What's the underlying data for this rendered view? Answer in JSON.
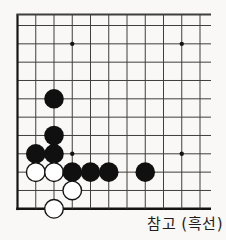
{
  "caption": "참고 (흑선)",
  "board": {
    "cols": 11,
    "rows": 11,
    "edges": {
      "left": true,
      "bottom": true,
      "top": false,
      "right": false
    },
    "star_points": [
      {
        "col": 4,
        "row": 2
      },
      {
        "col": 10,
        "row": 2
      },
      {
        "col": 4,
        "row": 8
      },
      {
        "col": 10,
        "row": 8
      }
    ],
    "stones": [
      {
        "col": 3,
        "row": 5,
        "color": "black"
      },
      {
        "col": 3,
        "row": 7,
        "color": "black"
      },
      {
        "col": 2,
        "row": 8,
        "color": "black"
      },
      {
        "col": 3,
        "row": 8,
        "color": "black"
      },
      {
        "col": 2,
        "row": 9,
        "color": "white"
      },
      {
        "col": 3,
        "row": 9,
        "color": "white"
      },
      {
        "col": 4,
        "row": 9,
        "color": "black"
      },
      {
        "col": 5,
        "row": 9,
        "color": "black"
      },
      {
        "col": 6,
        "row": 9,
        "color": "black"
      },
      {
        "col": 8,
        "row": 9,
        "color": "black"
      },
      {
        "col": 4,
        "row": 10,
        "color": "white"
      },
      {
        "col": 3,
        "row": 11,
        "color": "white"
      }
    ],
    "colors": {
      "line": "#3f3f3f",
      "edge": "#141414",
      "black_stone": "#101010",
      "white_stone": "#ffffff",
      "background": "#f9f8f6"
    }
  }
}
